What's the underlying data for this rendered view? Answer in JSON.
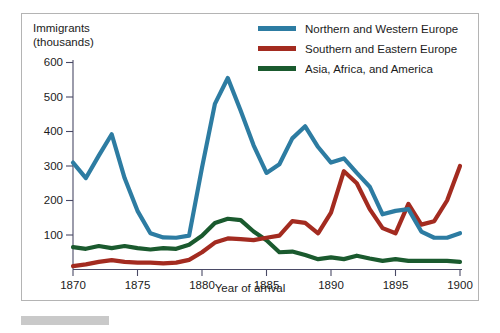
{
  "axes": {
    "ylabel_line1": "Immigrants",
    "ylabel_line2": "(thousands)",
    "xlabel": "Year of arrival",
    "yticks": [
      "100",
      "200",
      "300",
      "400",
      "500",
      "600"
    ],
    "xticks": [
      "1870",
      "1875",
      "1880",
      "1885",
      "1890",
      "1895",
      "1900"
    ]
  },
  "legend": {
    "items": [
      {
        "label": "Northern and Western Europe",
        "color": "#2d7ca2"
      },
      {
        "label": "Southern and Eastern Europe",
        "color": "#a32b20"
      },
      {
        "label": "Asia, Africa, and America",
        "color": "#1a5a2e"
      }
    ]
  },
  "chart_data": {
    "type": "line",
    "title": "",
    "xlabel": "Year of arrival",
    "ylabel": "Immigrants (thousands)",
    "xlim": [
      1870,
      1900
    ],
    "ylim": [
      0,
      620
    ],
    "yticks": [
      100,
      200,
      300,
      400,
      500,
      600
    ],
    "xticks": [
      1870,
      1875,
      1880,
      1885,
      1890,
      1895,
      1900
    ],
    "grid": false,
    "legend_position": "top-right",
    "x": [
      1870,
      1871,
      1872,
      1873,
      1874,
      1875,
      1876,
      1877,
      1878,
      1879,
      1880,
      1881,
      1882,
      1883,
      1884,
      1885,
      1886,
      1887,
      1888,
      1889,
      1890,
      1891,
      1892,
      1893,
      1894,
      1895,
      1896,
      1897,
      1898,
      1899,
      1900
    ],
    "series": [
      {
        "name": "Northern and Western Europe",
        "color": "#2d7ca2",
        "values": [
          310,
          265,
          330,
          392,
          265,
          170,
          105,
          93,
          92,
          98,
          295,
          480,
          555,
          460,
          360,
          280,
          305,
          380,
          415,
          355,
          310,
          322,
          280,
          240,
          160,
          170,
          175,
          110,
          92,
          92,
          105
        ]
      },
      {
        "name": "Southern and Eastern Europe",
        "color": "#a32b20",
        "values": [
          10,
          15,
          22,
          27,
          22,
          20,
          20,
          18,
          20,
          28,
          50,
          78,
          90,
          88,
          85,
          92,
          98,
          140,
          135,
          105,
          165,
          285,
          250,
          175,
          120,
          105,
          190,
          130,
          140,
          200,
          300
        ]
      },
      {
        "name": "Asia, Africa, and America",
        "color": "#1a5a2e",
        "values": [
          65,
          60,
          68,
          62,
          68,
          62,
          58,
          62,
          60,
          72,
          98,
          135,
          147,
          143,
          110,
          85,
          50,
          52,
          42,
          30,
          35,
          30,
          40,
          32,
          25,
          30,
          25,
          25,
          25,
          25,
          22
        ]
      }
    ]
  }
}
